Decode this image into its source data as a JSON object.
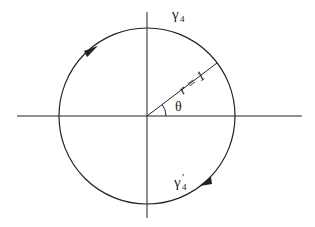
{
  "diagram": {
    "type": "unit-circle-contour",
    "center": {
      "x": 147,
      "y": 116
    },
    "radius": 88,
    "axes": {
      "horizontal": {
        "x1": 17,
        "x2": 302,
        "y": 116
      },
      "vertical": {
        "x": 147,
        "y1": 12,
        "y2": 218
      }
    },
    "radius_line": {
      "angle_deg": 37,
      "label": "r = 1"
    },
    "angle_label": "θ",
    "contours": [
      {
        "id": "gamma4",
        "label": "γ",
        "subscript": "4",
        "prime": "",
        "direction": "counterclockwise (upper arc)"
      },
      {
        "id": "gamma4prime",
        "label": "γ",
        "subscript": "4",
        "prime": "′",
        "direction": "clockwise (lower arc)"
      }
    ],
    "colors": {
      "stroke": "#222222",
      "background": "#ffffff"
    }
  }
}
